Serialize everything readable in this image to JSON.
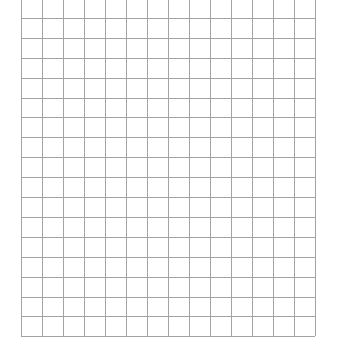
{
  "page": {
    "background_color": "#ffffff",
    "width": 337,
    "height": 352
  },
  "grid": {
    "name": "graph-paper-grid",
    "description": "Empty rectangular grid / graph paper",
    "line_color": "#a3a3a3",
    "line_width_px": 1,
    "background_color": "#ffffff",
    "columns": 14,
    "rows": 17,
    "cell_width_px": 21,
    "cell_height_px": 19.9,
    "origin_x_px": 21,
    "origin_y_px": -2,
    "right_edge_px": 315,
    "bottom_edge_px": 336,
    "top_row_clipped": true,
    "cells": []
  },
  "chart_data": {
    "type": "table",
    "title": "",
    "xlabel": "",
    "ylabel": "",
    "columns": 14,
    "rows": 17,
    "categories": [],
    "values": [],
    "grid": true,
    "legend": "none",
    "annotations": []
  }
}
